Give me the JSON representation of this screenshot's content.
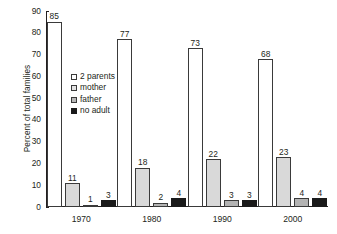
{
  "chart_data": {
    "type": "bar",
    "title": "",
    "xlabel": "",
    "ylabel": "Percent of total families",
    "ylim": [
      0,
      90
    ],
    "ytick_step": 10,
    "yticks": [
      0,
      10,
      20,
      30,
      40,
      50,
      60,
      70,
      80,
      90
    ],
    "categories": [
      "1970",
      "1980",
      "1990",
      "2000"
    ],
    "grid": false,
    "legend_position": "inside-upper-center-left",
    "series": [
      {
        "name": "2 parents",
        "color": "#ffffff",
        "values": [
          85,
          77,
          73,
          68
        ]
      },
      {
        "name": "mother",
        "color": "#d9d9d9",
        "values": [
          11,
          18,
          22,
          23
        ]
      },
      {
        "name": "father",
        "color": "#b3b3b3",
        "values": [
          1,
          2,
          3,
          4
        ]
      },
      {
        "name": "no adult",
        "color": "#1a1a1a",
        "values": [
          3,
          4,
          3,
          4
        ]
      }
    ],
    "data_labels": {
      "1970": [
        "85",
        "11",
        "1",
        "3"
      ],
      "1980": [
        "77",
        "18",
        "2",
        "4"
      ],
      "1990": [
        "73",
        "22",
        "3",
        "3"
      ],
      "2000": [
        "68",
        "23",
        "4",
        "4"
      ]
    }
  },
  "axis": {
    "ylabel": "Percent of total families",
    "ytick_labels": [
      "90",
      "80",
      "70",
      "60",
      "50",
      "40",
      "30",
      "20",
      "10",
      "0"
    ],
    "xtick_labels": [
      "1970",
      "1980",
      "1990",
      "2000"
    ]
  },
  "legend": {
    "items": [
      {
        "label": "2 parents"
      },
      {
        "label": "mother"
      },
      {
        "label": "father"
      },
      {
        "label": "no adult"
      }
    ]
  }
}
